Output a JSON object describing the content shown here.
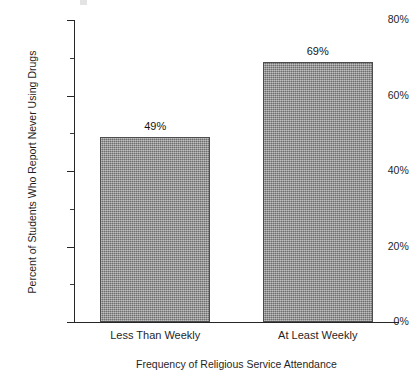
{
  "chart_data": {
    "type": "bar",
    "title": "",
    "subtitle": "",
    "categories": [
      "Less Than Weekly",
      "At Least Weekly"
    ],
    "values": [
      49,
      69
    ],
    "value_labels": [
      "49%",
      "69%"
    ],
    "xlabel": "Frequency of Religious Service Attendance",
    "ylabel": "Percent of Students Who Report Never Using Drugs",
    "ylim": [
      0,
      80
    ],
    "ytick_values": [
      0,
      20,
      40,
      60,
      80
    ],
    "ytick_labels": [
      "0%",
      "20%",
      "40%",
      "60%",
      "80%"
    ],
    "yminor_tick_values": [
      10,
      30,
      50,
      70
    ],
    "grid": false,
    "legend": false,
    "legend_position": "none",
    "bar_fill_color": "#8d8d8d",
    "bar_edge_color": "#4d4d4d",
    "axis_color": "#262626",
    "text_color": "#1f1f1f",
    "background_color": "#ffffff"
  }
}
